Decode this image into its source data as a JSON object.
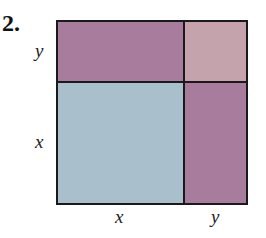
{
  "problem": {
    "number": "2."
  },
  "labels": {
    "left_top": "y",
    "left_bottom": "x",
    "bottom_left": "x",
    "bottom_right": "y"
  },
  "regions": {
    "top_left": {
      "name": "xy-rectangle-top",
      "color": "#a77c9d"
    },
    "top_right": {
      "name": "y-squared",
      "color": "#c4a3ad"
    },
    "bottom_left": {
      "name": "x-squared",
      "color": "#a9c0cc"
    },
    "bottom_right": {
      "name": "xy-rectangle-right",
      "color": "#a77c9d"
    }
  },
  "colors": {
    "border": "#1a1a1a"
  }
}
